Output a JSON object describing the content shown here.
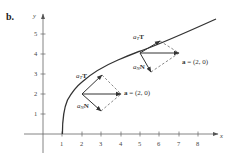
{
  "figure": {
    "part_label": "b.",
    "axes": {
      "x_label": "x",
      "y_label": "y",
      "x_ticks": [
        "1",
        "2",
        "3",
        "4",
        "5",
        "6",
        "7",
        "8"
      ],
      "y_ticks": [
        "1",
        "2",
        "3",
        "4",
        "5"
      ],
      "x_range": [
        -0.5,
        9
      ],
      "y_range": [
        -1,
        6
      ]
    },
    "curve": {
      "description": "x = 1 + y^2/4 (parabola opening right, starting at (1,0))",
      "color": "#333333"
    },
    "points": [
      {
        "at": [
          2,
          2
        ],
        "a_label_bold": "a",
        "a_value": " = (2, 0)",
        "aT_label": "a",
        "aT_sub": "T",
        "aT_vec": "T",
        "aN_label": "a",
        "aN_sub": "N",
        "aN_vec": "N"
      },
      {
        "at": [
          5,
          4
        ],
        "a_label_bold": "a",
        "a_value": " = (2, 0)",
        "aT_label": "a",
        "aT_sub": "T",
        "aT_vec": "T",
        "aN_label": "a",
        "aN_sub": "N",
        "aN_vec": "N"
      }
    ],
    "colors": {
      "ink": "#333333",
      "axis": "#555555",
      "background": "#ffffff"
    }
  }
}
